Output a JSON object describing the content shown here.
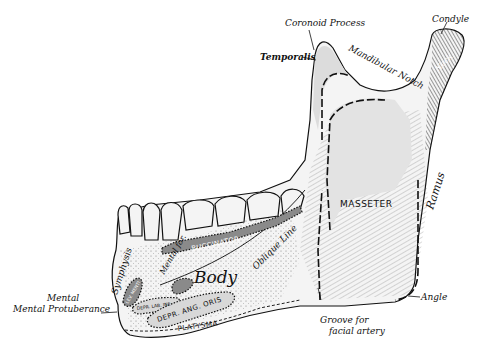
{
  "figure": {
    "labels": {
      "coronoid_process": "Coronoid Process",
      "condyle": "Condyle",
      "temporalis": "Temporalis",
      "mandibular_notch": "Mandibular Notch",
      "neck": "Neck",
      "masseter": "MASSETER",
      "ramus": "Ramus",
      "buccinator": "BUCCINATOR",
      "oblique_line": "Oblique Line",
      "mental_foramen": "Mental for.",
      "body": "Body",
      "symphysis": "Symphysis",
      "levator_menti": "LEV. MENTI",
      "depr_lab_inf": "DEPR. LAB. INF.",
      "depr_ang_oris": "DEPR. ANG. ORIS",
      "platysma": "PLATYSMA",
      "mental": "Mental",
      "mental_protuberance": "Mental Protuberance",
      "angle": "Angle",
      "groove_line1": "Groove for",
      "groove_line2": "facial artery"
    }
  }
}
